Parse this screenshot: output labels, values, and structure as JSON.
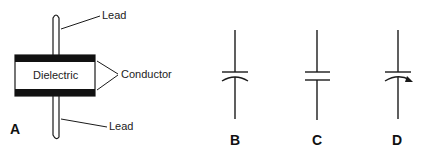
{
  "figure_a": {
    "id_label": "A",
    "lead_top_label": "Lead",
    "lead_bottom_label": "Lead",
    "dielectric_label": "Dielectric",
    "conductor_label": "Conductor"
  },
  "symbols": [
    {
      "id_label": "B",
      "type": "capacitor-polarized-curved-plate"
    },
    {
      "id_label": "C",
      "type": "capacitor-fixed"
    },
    {
      "id_label": "D",
      "type": "capacitor-variable-arrow"
    }
  ],
  "colors": {
    "stroke": "#1a1a1a",
    "background": "#ffffff"
  }
}
